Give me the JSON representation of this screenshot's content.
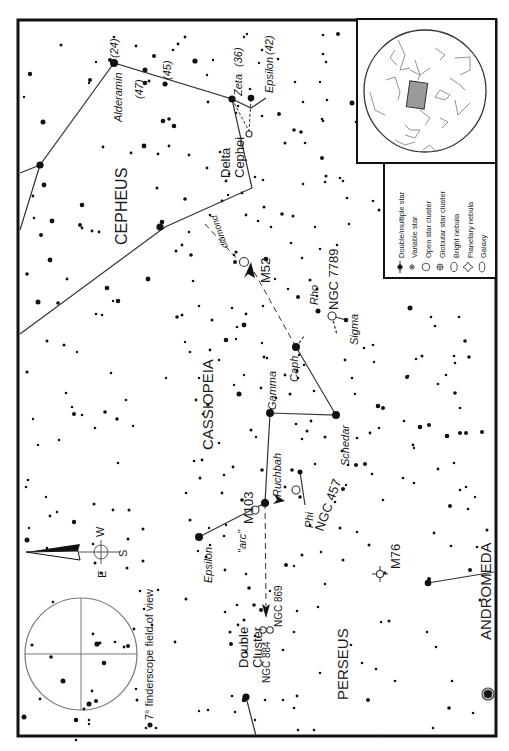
{
  "map": {
    "orientation": "rotated 90deg clockwise (text reads bottom-to-top)",
    "colors": {
      "ink": "#111111",
      "line": "#333333",
      "inset_fill": "#9a9a9a",
      "paper": "#ffffff"
    }
  },
  "constellations": {
    "cepheus": "CEPHEUS",
    "cassiopeia": "CASSIOPEIA",
    "perseus": "PERSEUS",
    "andromeda": "ANDROMEDA"
  },
  "stars": {
    "alderamin": "Alderamin",
    "alderamin_num": "(24)",
    "n47": "(47)",
    "n45": "(45)",
    "zeta": "Zeta",
    "zeta_num": "(36)",
    "epsilon_cep": "Epsilon",
    "epsilon_cep_num": "(42)",
    "delta_line1": "Delta",
    "delta_line2": "Cephei",
    "caph": "Caph",
    "schedar": "Schedar",
    "gamma": "Gamma",
    "ruchbah": "Ruchbah",
    "epsilon_cas": "Epsilon",
    "phi": "Phi",
    "rho": "Rho",
    "sigma": "Sigma"
  },
  "objects": {
    "m52": "M52",
    "ngc7789": "NGC 7789",
    "m103": "M103",
    "ngc457": "NGC 457",
    "arc": "\"arc\"",
    "diamond": "diamond",
    "double_cluster_line1": "Double",
    "double_cluster_line2": "Cluster",
    "ngc884": "NGC 884",
    "ngc869": "NGC 869",
    "m76": "M76"
  },
  "compass": {
    "e": "E",
    "w": "W",
    "s": "S"
  },
  "finderscope": {
    "caption": "7° finderscope field of view"
  },
  "legend": {
    "items": [
      {
        "symbol": "double-star",
        "label": "Double/multiple star"
      },
      {
        "symbol": "variable-star",
        "label": "Variable star"
      },
      {
        "symbol": "open-cluster",
        "label": "Open star cluster"
      },
      {
        "symbol": "globular-cluster",
        "label": "Globular star cluster"
      },
      {
        "symbol": "bright-nebula",
        "label": "Bright nebula"
      },
      {
        "symbol": "planetary-nebula",
        "label": "Planetary nebula"
      },
      {
        "symbol": "galaxy",
        "label": "Galaxy"
      }
    ]
  }
}
